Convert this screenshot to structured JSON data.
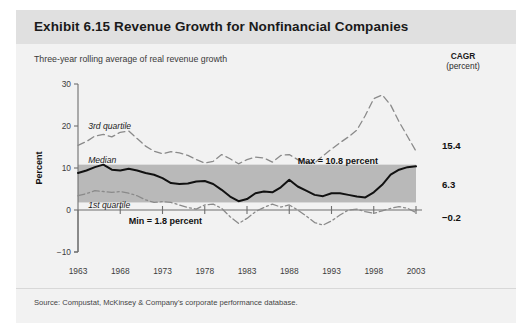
{
  "exhibit": {
    "title": "Exhibit 6.15 Revenue Growth for Nonfinancial Companies",
    "subtitle": "Three-year rolling average of real revenue growth",
    "cagr_header_line1": "CAGR",
    "cagr_header_line2": "(percent)",
    "source": "Source: Compustat, McKinsey & Company's corporate performance database."
  },
  "colors": {
    "page_background": "#f2f2f2",
    "title_bar": "#e0e0e0",
    "band_fill": "#b9b9b9",
    "median_line": "#111111",
    "quartile_line": "#8a8a8a",
    "axis": "#6f6f6f",
    "text": "#1a1a1a"
  },
  "chart_data": {
    "type": "line",
    "title": "Revenue Growth for Nonfinancial Companies",
    "subtitle": "Three-year rolling average of real revenue growth",
    "xlabel": "",
    "ylabel": "Percent",
    "ylim": [
      -10,
      30
    ],
    "yticks": [
      -10,
      0,
      10,
      20,
      30
    ],
    "ytick_labels": [
      "−10",
      "0",
      "10",
      "20",
      "30"
    ],
    "xlim": [
      1963,
      2003
    ],
    "xticks": [
      1963,
      1968,
      1973,
      1978,
      1983,
      1988,
      1993,
      1998,
      2003
    ],
    "xtick_labels": [
      "1963",
      "1968",
      "1973",
      "1978",
      "1983",
      "1988",
      "1993",
      "1998",
      "2003"
    ],
    "grid": false,
    "legend_position": "inline-annotations",
    "x": [
      1963,
      1964,
      1965,
      1966,
      1967,
      1968,
      1969,
      1970,
      1971,
      1972,
      1973,
      1974,
      1975,
      1976,
      1977,
      1978,
      1979,
      1980,
      1981,
      1982,
      1983,
      1984,
      1985,
      1986,
      1987,
      1988,
      1989,
      1990,
      1991,
      1992,
      1993,
      1994,
      1995,
      1996,
      1997,
      1998,
      1999,
      2000,
      2001,
      2002,
      2003
    ],
    "series": [
      {
        "name": "3rd quartile",
        "style": "dashed",
        "values": [
          15.4,
          16.3,
          17.6,
          18.0,
          17.4,
          18.5,
          18.8,
          17.0,
          15.2,
          14.0,
          13.4,
          13.9,
          13.6,
          13.0,
          12.0,
          11.2,
          11.6,
          13.2,
          12.2,
          11.0,
          12.0,
          12.6,
          12.4,
          11.4,
          13.0,
          13.2,
          12.0,
          11.4,
          11.2,
          12.9,
          14.5,
          16.0,
          17.4,
          19.0,
          22.5,
          26.5,
          27.4,
          25.0,
          21.0,
          17.5,
          14.0
        ]
      },
      {
        "name": "Median",
        "style": "solid",
        "values": [
          8.8,
          9.4,
          10.2,
          10.8,
          9.6,
          9.4,
          9.8,
          9.4,
          8.8,
          8.4,
          7.6,
          6.4,
          6.2,
          6.3,
          6.8,
          6.9,
          6.2,
          4.8,
          3.2,
          2.1,
          2.6,
          4.0,
          4.4,
          4.2,
          5.4,
          7.2,
          5.6,
          4.6,
          3.6,
          3.3,
          4.0,
          4.0,
          3.6,
          3.2,
          3.0,
          4.2,
          6.0,
          8.4,
          9.6,
          10.2,
          10.4
        ]
      },
      {
        "name": "1st quartile",
        "style": "dash-dot",
        "values": [
          3.4,
          3.9,
          4.6,
          4.4,
          4.2,
          4.4,
          4.0,
          3.4,
          2.4,
          1.8,
          2.0,
          1.8,
          1.2,
          0.6,
          0.2,
          1.2,
          1.4,
          0.4,
          -1.6,
          -3.2,
          -2.0,
          -0.4,
          0.6,
          1.4,
          0.7,
          1.2,
          0.0,
          -1.4,
          -3.0,
          -3.6,
          -2.6,
          -1.2,
          0.0,
          0.2,
          -0.4,
          -0.8,
          -0.2,
          0.4,
          0.8,
          0.4,
          -0.6
        ]
      }
    ],
    "band": {
      "label": "median range band",
      "lower": 1.8,
      "upper": 10.8
    },
    "annotations": [
      {
        "id": "max",
        "text": "Max = 10.8 percent",
        "x": 1989,
        "y": 11.6
      },
      {
        "id": "min",
        "text": "Min = 1.8 percent",
        "x": 1969,
        "y": -2.6
      },
      {
        "id": "third-quartile-label",
        "text": "3rd quartile",
        "x": 1964.2,
        "y": 20.0
      },
      {
        "id": "median-label",
        "text": "Median",
        "x": 1964.2,
        "y": 11.8
      },
      {
        "id": "first-quartile-label",
        "text": "1st quartile",
        "x": 1964.2,
        "y": 1.2
      }
    ],
    "cagr": [
      {
        "series": "3rd quartile",
        "value": "15.4"
      },
      {
        "series": "Median",
        "value": "6.3"
      },
      {
        "series": "1st quartile",
        "value": "−0.2"
      }
    ]
  }
}
